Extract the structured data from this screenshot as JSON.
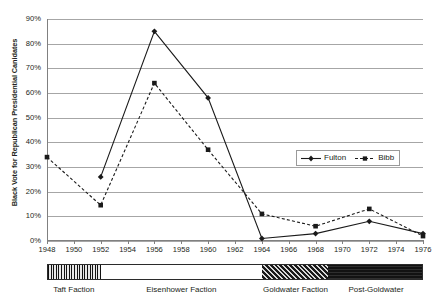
{
  "chart_data": {
    "type": "line",
    "title": "",
    "xlabel": "",
    "ylabel": "Black Vote for Republican Presidential Canidates",
    "x": [
      1948,
      1952,
      1956,
      1960,
      1964,
      1968,
      1972,
      1976
    ],
    "xlim": [
      1948,
      1976
    ],
    "ylim": [
      0,
      90
    ],
    "ytick_labels": [
      "0%",
      "10%",
      "20%",
      "30%",
      "40%",
      "50%",
      "60%",
      "70%",
      "80%",
      "90%"
    ],
    "ytick_values": [
      0,
      10,
      20,
      30,
      40,
      50,
      60,
      70,
      80,
      90
    ],
    "xtick_labels": [
      "1948",
      "1950",
      "1952",
      "1954",
      "1956",
      "1958",
      "1960",
      "1962",
      "1964",
      "1966",
      "1968",
      "1970",
      "1972",
      "1974",
      "1976"
    ],
    "xtick_values": [
      1948,
      1950,
      1952,
      1954,
      1956,
      1958,
      1960,
      1962,
      1964,
      1966,
      1968,
      1970,
      1972,
      1974,
      1976
    ],
    "grid": true,
    "legend_position": "center-right",
    "series": [
      {
        "name": "Fulton",
        "line_style": "solid",
        "marker": "diamond",
        "color": "#1a1a1a",
        "x": [
          1952,
          1956,
          1960,
          1964,
          1968,
          1972,
          1976
        ],
        "values": [
          26,
          85,
          58,
          1,
          3,
          8,
          3
        ]
      },
      {
        "name": "Bibb",
        "line_style": "dashed",
        "marker": "square",
        "color": "#1a1a1a",
        "x": [
          1948,
          1952,
          1956,
          1960,
          1964,
          1968,
          1972,
          1976
        ],
        "values": [
          34,
          14.5,
          64,
          37,
          11,
          6,
          13,
          2
        ]
      }
    ],
    "annotations": {
      "faction_bar": [
        {
          "label": "Taft Faction",
          "start": 1948,
          "end": 1952,
          "pattern": "vertical-stripes"
        },
        {
          "label": "Eisenhower Faction",
          "start": 1952,
          "end": 1964,
          "pattern": "solid-white"
        },
        {
          "label": "Goldwater Faction",
          "start": 1964,
          "end": 1969,
          "pattern": "diagonal-hatch"
        },
        {
          "label": "Post-Goldwater",
          "start": 1969,
          "end": 1976,
          "pattern": "solid-dark"
        }
      ]
    }
  },
  "legend": {
    "items": [
      {
        "label": "Fulton"
      },
      {
        "label": "Bibb"
      }
    ]
  }
}
